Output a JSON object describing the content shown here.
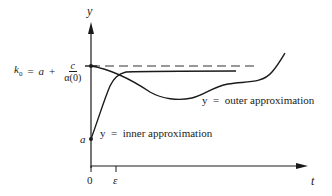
{
  "diagram": {
    "axes": {
      "y_label": "y",
      "x_label": "t",
      "x_ticks": [
        {
          "label": "0",
          "position": "origin"
        },
        {
          "label": "ε",
          "position": "epsilon"
        }
      ]
    },
    "levels": {
      "k0": {
        "symbol": "k",
        "subscript": "0",
        "equals": "=",
        "a_term": "a",
        "plus": "+",
        "numerator": "c",
        "denominator": "α(0)",
        "line_style": "dashed"
      },
      "a_label": "a"
    },
    "curves": {
      "outer": {
        "label": "y  =  outer approximation",
        "description": "starts at k0 at t=0, dips to a minimum, rises to a plateau, then increases steeply"
      },
      "inner": {
        "label": "y  =  inner approximation",
        "description": "starts at a at t=0, rises steeply near t=ε, then levels off just below k0"
      }
    },
    "colors": {
      "ink": "#1a1a1a",
      "dashed": "#333333",
      "background": "#ffffff"
    }
  }
}
